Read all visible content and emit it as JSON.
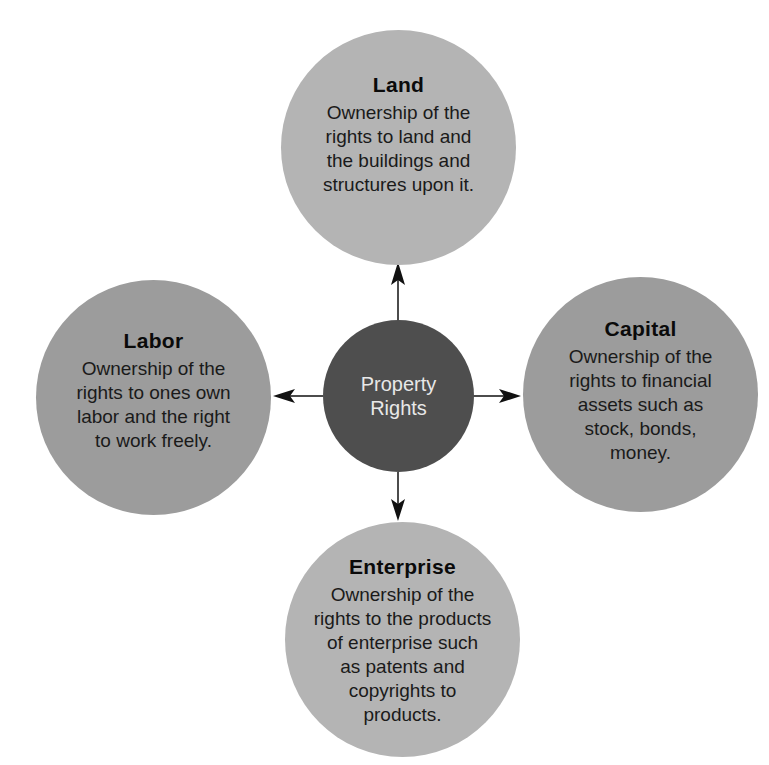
{
  "diagram": {
    "center": {
      "lines": [
        "Property",
        "Rights"
      ],
      "color": "#4e4e4e"
    },
    "nodes": {
      "land": {
        "title": "Land",
        "lines": [
          "Ownership of the",
          "rights to land and",
          "the buildings and",
          "structures upon it."
        ],
        "color": "#b4b4b4"
      },
      "labor": {
        "title": "Labor",
        "lines": [
          "Ownership of the",
          "rights to ones own",
          "labor and the right",
          "to work freely."
        ],
        "color": "#9c9c9c"
      },
      "capital": {
        "title": "Capital",
        "lines": [
          "Ownership of the",
          "rights to financial",
          "assets such as",
          "stock, bonds,",
          "money."
        ],
        "color": "#9c9c9c"
      },
      "enterprise": {
        "title": "Enterprise",
        "lines": [
          "Ownership of the",
          "rights to the products",
          "of enterprise such",
          "as patents and",
          "copyrights to",
          "products."
        ],
        "color": "#b4b4b4"
      }
    },
    "arrows": [
      {
        "from": "center",
        "to": "land",
        "direction": "up"
      },
      {
        "from": "center",
        "to": "labor",
        "direction": "left"
      },
      {
        "from": "center",
        "to": "capital",
        "direction": "right"
      },
      {
        "from": "center",
        "to": "enterprise",
        "direction": "down"
      }
    ]
  }
}
